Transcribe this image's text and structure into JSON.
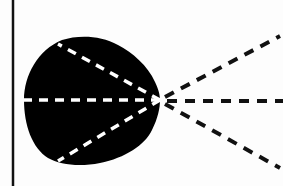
{
  "diagram": {
    "type": "radiating-dashed-lines-from-blob",
    "colors": {
      "background": "#fdfdfd",
      "blob": "#000000",
      "inner_dash": "#ffffff",
      "outer_dash": "#111111",
      "border": "#111111"
    },
    "border": {
      "x": 13,
      "y1": 0,
      "y2": 186
    },
    "origin": {
      "x": 160,
      "y": 100
    },
    "inner_lines": [
      {
        "name": "upper-inner-line",
        "x2": 58,
        "y2": 45
      },
      {
        "name": "middle-inner-line",
        "x2": 25,
        "y2": 100
      },
      {
        "name": "lower-inner-line",
        "x2": 58,
        "y2": 160
      }
    ],
    "outer_lines": [
      {
        "name": "upper-outer-line",
        "x2": 280,
        "y2": 36
      },
      {
        "name": "middle-outer-line",
        "x2": 283,
        "y2": 101
      },
      {
        "name": "lower-outer-line",
        "x2": 280,
        "y2": 168
      }
    ]
  }
}
